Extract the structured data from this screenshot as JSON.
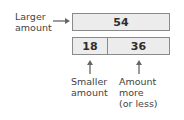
{
  "diagram": {
    "type": "tape-diagram",
    "larger_label": [
      "Larger",
      "amount"
    ],
    "top_bar": {
      "value": "54"
    },
    "bottom_bar": {
      "parts": [
        {
          "value": "18"
        },
        {
          "value": "36"
        }
      ]
    },
    "smaller_label": [
      "Smaller",
      "amount"
    ],
    "difference_label": [
      "Amount",
      "more",
      "(or less)"
    ],
    "colors": {
      "bar_fill": "#ececec",
      "bar_border": "#8a8a8a",
      "arrow": "#666666",
      "text": "#444444"
    }
  }
}
